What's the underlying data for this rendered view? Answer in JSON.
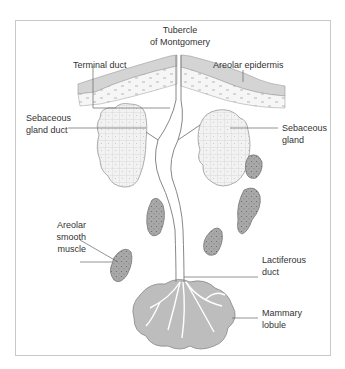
{
  "diagram": {
    "labels": {
      "tubercle": [
        "Tubercle",
        "of Montgomery"
      ],
      "terminal_duct": [
        "Terminal duct"
      ],
      "areolar_epidermis": [
        "Areolar epidermis"
      ],
      "sebaceous_gland_duct": [
        "Sebaceous",
        "gland duct"
      ],
      "sebaceous_gland": [
        "Sebaceous",
        "gland"
      ],
      "areolar_smooth_muscle": [
        "Areolar",
        "smooth",
        "muscle"
      ],
      "lactiferous_duct": [
        "Lactiferous",
        "duct"
      ],
      "mammary_lobule": [
        "Mammary",
        "lobule"
      ]
    },
    "colors": {
      "line": "#888888",
      "gland_fill": "#f2f2f2",
      "muscle_fill": "#a9a9a9",
      "lobule_fill": "#bdbdbd",
      "epidermis_fill": "#dcdcdc",
      "frame": "#c8c8c8"
    }
  }
}
